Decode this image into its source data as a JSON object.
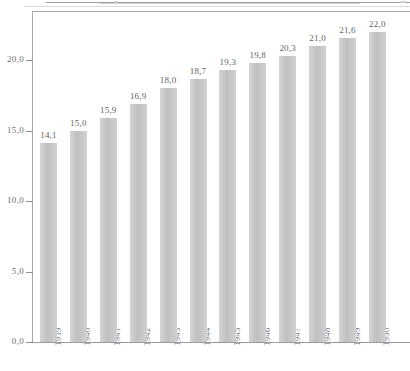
{
  "chart_data": {
    "type": "bar",
    "title": "",
    "subtitle": "",
    "xlabel": "",
    "ylabel": "",
    "categories": [
      "1939",
      "1940",
      "1941",
      "1942",
      "1943",
      "1944",
      "1945",
      "1946",
      "1947",
      "1948",
      "1949",
      "1950"
    ],
    "values": [
      14.1,
      15.0,
      15.9,
      16.9,
      18.0,
      18.7,
      19.3,
      19.8,
      20.3,
      21.0,
      21.6,
      22.0
    ],
    "value_labels": [
      "14,1",
      "15,0",
      "15,9",
      "16,9",
      "18,0",
      "18,7",
      "19,3",
      "19,8",
      "20,3",
      "21,0",
      "21,6",
      "22,0"
    ],
    "ylim": [
      0,
      23.5
    ],
    "yticks": [
      0,
      5,
      10,
      15,
      20
    ],
    "ytick_labels": [
      "0,0",
      "5,0",
      "10,0",
      "15,0",
      "20,0"
    ],
    "grid": false,
    "legend": null,
    "decimal_separator": ",",
    "series": [
      {
        "name": "",
        "values": [
          14.1,
          15.0,
          15.9,
          16.9,
          18.0,
          18.7,
          19.3,
          19.8,
          20.3,
          21.0,
          21.6,
          22.0
        ]
      }
    ]
  },
  "style": {
    "bar_color": "#c6c6c6",
    "axis_color": "#a8a8a8",
    "label_color": "#6a6a6a",
    "background": "#ffffff"
  }
}
